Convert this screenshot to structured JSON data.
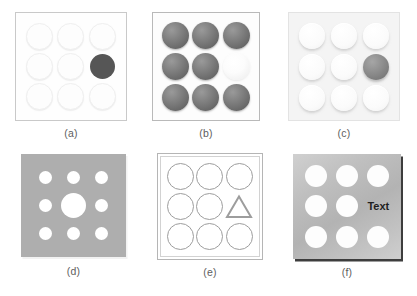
{
  "figure": {
    "title": "",
    "panel_count": 6,
    "grid_rows": 2,
    "grid_cols": 3
  },
  "panels": [
    {
      "id": "a",
      "caption": "(a)",
      "style": "faint-outlines-on-white",
      "background_color": "#fefefe",
      "border_color": "#c9c9c9",
      "grid": "3x3",
      "anomaly": {
        "type": "dark-filled-circle",
        "row": 2,
        "col": 3,
        "color": "#565656"
      },
      "normal_shape_color": "#fdfdfd"
    },
    {
      "id": "b",
      "caption": "(b)",
      "style": "dark-spheres-on-white",
      "background_color": "#fdfdfd",
      "border_color": "#b9b9b9",
      "grid": "3x3",
      "anomaly": {
        "type": "pale-sphere",
        "row": 2,
        "col": 3,
        "color": "#f5f5f5"
      },
      "normal_shape_color": "#7e7e7e"
    },
    {
      "id": "c",
      "caption": "(c)",
      "style": "embossed-light-circles",
      "background_color": "#f4f4f4",
      "border_color": "#e3e3e3",
      "grid": "3x3",
      "anomaly": {
        "type": "gray-sphere",
        "row": 2,
        "col": 3,
        "color": "#8d8d8d"
      },
      "normal_shape_color": "#fbfbfb"
    },
    {
      "id": "d",
      "caption": "(d)",
      "style": "gray-plate-white-holes",
      "background_color": "#aeaeae",
      "border_color": "#f2f2f2",
      "grid": "3x3",
      "anomaly": {
        "type": "enlarged-hole",
        "row": 2,
        "col": 2,
        "color": "#ffffff"
      },
      "normal_shape_color": "#ffffff"
    },
    {
      "id": "e",
      "caption": "(e)",
      "style": "outlined-shapes-double-border",
      "background_color": "#ffffff",
      "border_color": "#b5b5b5",
      "grid": "3x3",
      "anomaly": {
        "type": "triangle-outline",
        "row": 2,
        "col": 3,
        "color": "#9d9d9d"
      },
      "normal_shape_color": "#9d9d9d"
    },
    {
      "id": "f",
      "caption": "(f)",
      "style": "gradient-plate-holes-with-text",
      "background_color": "#bfbfbf",
      "border_color": "#3d3d3d",
      "grid": "3x3",
      "anomaly": {
        "type": "text-label",
        "row": 2,
        "col": 3,
        "label": "Text",
        "color": "#1f1f1f"
      },
      "normal_shape_color": "#fdfdfd"
    }
  ],
  "captions": {
    "a": "(a)",
    "b": "(b)",
    "c": "(c)",
    "d": "(d)",
    "e": "(e)",
    "f": "(f)"
  },
  "labels": {
    "panel_f_text": "Text"
  }
}
